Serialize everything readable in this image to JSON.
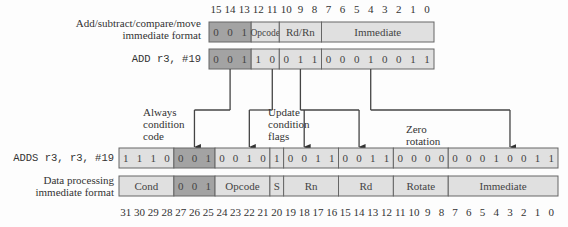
{
  "colors": {
    "dark_field": "#a3a3a3",
    "light_field": "#e0e0e0",
    "border": "#666666",
    "line": "#444444"
  },
  "top": {
    "bit_numbers": [
      "15",
      "14",
      "13",
      "12",
      "11",
      "10",
      "9",
      "8",
      "7",
      "6",
      "5",
      "4",
      "3",
      "2",
      "1",
      "0"
    ],
    "format_label_line1": "Add/subtract/compare/move",
    "format_label_line2": "immediate format",
    "format_fields": [
      {
        "label": "0 0 1",
        "msb": 15,
        "lsb": 13,
        "shade": "dark"
      },
      {
        "label": "Opcode",
        "msb": 12,
        "lsb": 11,
        "shade": "light"
      },
      {
        "label": "Rd/Rn",
        "msb": 10,
        "lsb": 8,
        "shade": "light"
      },
      {
        "label": "Immediate",
        "msb": 7,
        "lsb": 0,
        "shade": "light"
      }
    ],
    "instruction_label": "ADD r3, #19",
    "instruction_fields": [
      {
        "bits": [
          "0",
          "0",
          "1"
        ],
        "msb": 15,
        "lsb": 13,
        "shade": "dark"
      },
      {
        "bits": [
          "1",
          "0"
        ],
        "msb": 12,
        "lsb": 11,
        "shade": "light"
      },
      {
        "bits": [
          "0",
          "1",
          "1"
        ],
        "msb": 10,
        "lsb": 8,
        "shade": "light"
      },
      {
        "bits": [
          "0",
          "0",
          "0",
          "1",
          "0",
          "0",
          "1",
          "1"
        ],
        "msb": 7,
        "lsb": 0,
        "shade": "light"
      }
    ]
  },
  "annotations": {
    "always_condition": [
      "Always",
      "condition",
      "code"
    ],
    "update_flags": [
      "Update",
      "condition",
      "flags"
    ],
    "zero_rotation": [
      "Zero",
      "rotation"
    ]
  },
  "bottom": {
    "instruction_label": "ADDS r3, r3, #19",
    "instruction_fields": [
      {
        "bits": [
          "1",
          "1",
          "1",
          "0"
        ],
        "msb": 31,
        "lsb": 28,
        "shade": "light"
      },
      {
        "bits": [
          "0",
          "0",
          "1"
        ],
        "msb": 27,
        "lsb": 25,
        "shade": "dark"
      },
      {
        "bits": [
          "0",
          "0",
          "1",
          "0"
        ],
        "msb": 24,
        "lsb": 21,
        "shade": "light"
      },
      {
        "bits": [
          "1"
        ],
        "msb": 20,
        "lsb": 20,
        "shade": "light"
      },
      {
        "bits": [
          "0",
          "0",
          "1",
          "1"
        ],
        "msb": 19,
        "lsb": 16,
        "shade": "light"
      },
      {
        "bits": [
          "0",
          "0",
          "1",
          "1"
        ],
        "msb": 15,
        "lsb": 12,
        "shade": "light"
      },
      {
        "bits": [
          "0",
          "0",
          "0",
          "0"
        ],
        "msb": 11,
        "lsb": 8,
        "shade": "light"
      },
      {
        "bits": [
          "0",
          "0",
          "0",
          "1",
          "0",
          "0",
          "1",
          "1"
        ],
        "msb": 7,
        "lsb": 0,
        "shade": "light"
      }
    ],
    "format_label_line1": "Data processing",
    "format_label_line2": "immediate format",
    "format_fields": [
      {
        "label": "Cond",
        "msb": 31,
        "lsb": 28,
        "shade": "light"
      },
      {
        "label": "0 0 1",
        "msb": 27,
        "lsb": 25,
        "shade": "dark"
      },
      {
        "label": "Opcode",
        "msb": 24,
        "lsb": 21,
        "shade": "light"
      },
      {
        "label": "S",
        "msb": 20,
        "lsb": 20,
        "shade": "light"
      },
      {
        "label": "Rn",
        "msb": 19,
        "lsb": 16,
        "shade": "light"
      },
      {
        "label": "Rd",
        "msb": 15,
        "lsb": 12,
        "shade": "light"
      },
      {
        "label": "Rotate",
        "msb": 11,
        "lsb": 8,
        "shade": "light"
      },
      {
        "label": "Immediate",
        "msb": 7,
        "lsb": 0,
        "shade": "light"
      }
    ],
    "bit_numbers": [
      "31",
      "30",
      "29",
      "28",
      "27",
      "26",
      "25",
      "24",
      "23",
      "22",
      "21",
      "20",
      "19",
      "18",
      "17",
      "16",
      "15",
      "14",
      "13",
      "12",
      "11",
      "10",
      "9",
      "8",
      "7",
      "6",
      "5",
      "4",
      "3",
      "2",
      "1",
      "0"
    ]
  },
  "mappings": [
    {
      "name": "arrow-opcode-prefix-to-fixed-bits",
      "from_top_bit": 14,
      "to_bottom_bits": [
        26
      ]
    },
    {
      "name": "arrow-opcode-to-opcode",
      "from_top_bit": 11,
      "to_bottom_bits": [
        22
      ]
    },
    {
      "name": "arrow-rdrn-to-rn-rd",
      "from_top_bit": 9,
      "to_bottom_bits": [
        18,
        14
      ]
    },
    {
      "name": "arrow-immediate-to-immediate",
      "from_top_bit": 4,
      "to_bottom_bits": [
        3
      ]
    }
  ]
}
